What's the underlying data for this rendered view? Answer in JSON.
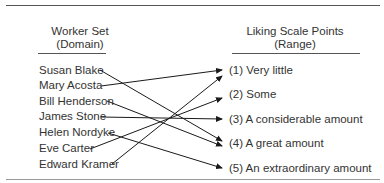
{
  "diagram": {
    "domain_header": {
      "line1": "Worker Set",
      "line2": "(Domain)"
    },
    "range_header": {
      "line1": "Liking Scale Points",
      "line2": "(Range)"
    },
    "domain": [
      "Susan Blake",
      "Mary Acosta",
      "Bill Henderson",
      "James Stone",
      "Helen Nordyke",
      "Eve Carter",
      "Edward Kramer"
    ],
    "range": [
      "(1) Very little",
      "(2) Some",
      "(3) A considerable amount",
      "(4) A great amount",
      "(5) An extraordinary amount"
    ],
    "mapping": [
      {
        "from": "Susan Blake",
        "to": "(4) A great amount"
      },
      {
        "from": "Mary Acosta",
        "to": "(1) Very little"
      },
      {
        "from": "Bill Henderson",
        "to": "(4) A great amount"
      },
      {
        "from": "James Stone",
        "to": "(3) A considerable amount"
      },
      {
        "from": "Helen Nordyke",
        "to": "(5) An extraordinary amount"
      },
      {
        "from": "Eve Carter",
        "to": "(2) Some"
      },
      {
        "from": "Edward Kramer",
        "to": "(1) Very little"
      }
    ],
    "line_color": "#1a1a1a"
  }
}
